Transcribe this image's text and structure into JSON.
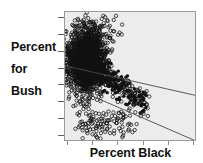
{
  "figure": {
    "background_color": "#ffffff",
    "panel_color": "#ececec",
    "panel_border_color": "#9a9a9a",
    "marker_color": "#111111",
    "line_color": "#4a4a4a"
  },
  "axis_labels": {
    "y_lines": [
      "Percent",
      "for",
      "Bush"
    ],
    "x_label": "Percent Black"
  },
  "chart_data": {
    "type": "scatter",
    "title": "",
    "xlabel": "Percent Black",
    "ylabel": "Percent for Bush",
    "grid": false,
    "legend": null,
    "xlim": [
      0,
      100
    ],
    "ylim": [
      0,
      100
    ],
    "x_tick_count": 6,
    "y_tick_count": 8,
    "tick_labels_shown": false,
    "marker": "open-circle",
    "marker_size_px": 3,
    "series": [
      {
        "name": "counties",
        "n_points": 2400,
        "cluster_core": {
          "x_center": 17,
          "y_center": 62,
          "x_spread": 7,
          "y_spread": 12,
          "n": 1750
        },
        "cluster_tail": {
          "x_from": 22,
          "x_to": 62,
          "y_from": 58,
          "y_to": 26,
          "n": 420
        },
        "outliers_low": {
          "x_from": 10,
          "x_to": 52,
          "y_from": 22,
          "y_to": 4,
          "n": 110
        },
        "outliers_high": {
          "x_from": 4,
          "x_to": 45,
          "y_from": 80,
          "y_to": 95,
          "n": 40
        }
      }
    ],
    "fit_lines": [
      {
        "name": "ols-fit",
        "style": "solid",
        "x0": 0,
        "y0": 58,
        "x1": 100,
        "y1": 35,
        "slope_sign": "negative",
        "note": "shallow downward trend line spanning full width"
      },
      {
        "name": "robust-fit",
        "style": "solid",
        "x0": 0,
        "y0": 44,
        "x1": 100,
        "y1": 0,
        "slope_sign": "negative",
        "note": "steeper downward line running to lower right corner"
      }
    ]
  }
}
